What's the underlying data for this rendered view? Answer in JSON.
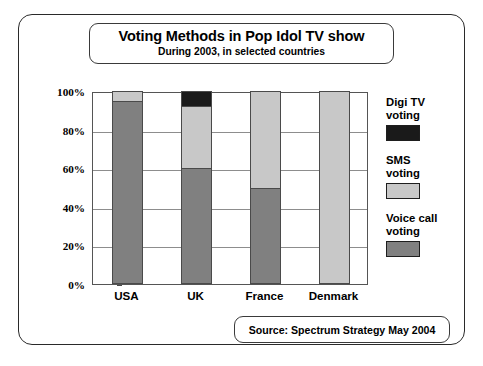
{
  "title_box": {
    "title": "Voting Methods in Pop Idol TV show",
    "subtitle": "During 2003, in selected countries"
  },
  "source_box": {
    "text": "Source: Spectrum Strategy May 2004"
  },
  "legend": {
    "items": [
      {
        "label": "Digi TV\nvoting",
        "color": "#1a1a1a"
      },
      {
        "label": "SMS\nvoting",
        "color": "#c8c8c8"
      },
      {
        "label": "Voice call\nvoting",
        "color": "#808080"
      }
    ]
  },
  "axis": {
    "y_ticks": [
      "100%",
      "80%",
      "60%",
      "40%",
      "20%",
      "0%"
    ]
  },
  "chart_data": {
    "type": "bar",
    "stacked": true,
    "title": "Voting Methods in Pop Idol TV show",
    "subtitle": "During 2003, in selected countries",
    "xlabel": "",
    "ylabel": "",
    "ylim": [
      0,
      100
    ],
    "yticks": [
      0,
      20,
      40,
      60,
      80,
      100
    ],
    "ytick_labels": [
      "0%",
      "20%",
      "40%",
      "60%",
      "80%",
      "100%"
    ],
    "grid": true,
    "legend_position": "right",
    "categories": [
      "USA",
      "UK",
      "France",
      "Denmark"
    ],
    "series": [
      {
        "name": "Voice call voting",
        "color": "#808080",
        "values": [
          95,
          60,
          50,
          0
        ]
      },
      {
        "name": "SMS voting",
        "color": "#c8c8c8",
        "values": [
          5,
          32,
          50,
          100
        ]
      },
      {
        "name": "Digi TV voting",
        "color": "#1a1a1a",
        "values": [
          0,
          8,
          0,
          0
        ]
      }
    ],
    "source": "Source: Spectrum Strategy May 2004"
  }
}
